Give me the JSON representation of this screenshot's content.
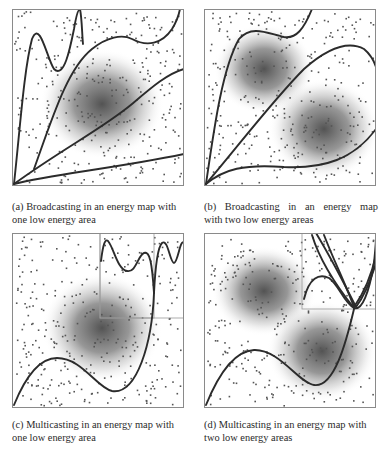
{
  "figure": {
    "panels": [
      {
        "id": "a",
        "caption_line1": "(a) Broadcasting in an energy map with",
        "caption_line2": "one low energy area",
        "mode": "broadcasting",
        "low_energy_areas": 1,
        "box": {
          "x": 12,
          "y": 9,
          "w": 172,
          "h": 177
        },
        "blobs": [
          {
            "cx": 90,
            "cy": 95,
            "rx": 62,
            "ry": 55
          }
        ],
        "sub_boxes": [],
        "curves": [
          "M2,175 C8,120 12,60 20,30 C28,10 35,50 42,60 C52,70 58,40 62,20 C64,8 66,0 68,0 M68,0 C70,10 70,25 71,35",
          "M22,160 C40,110 55,60 80,40 C95,28 110,25 120,30 C135,38 150,35 160,20 C165,12 167,5 168,0",
          "M2,175 C50,140 90,120 120,95 C140,78 155,65 172,60",
          "M2,175 C40,165 100,160 172,145"
        ],
        "dot_seed": 11
      },
      {
        "id": "b",
        "caption_line1": "(b) Broadcasting in an energy map",
        "caption_line2": "with two low energy areas",
        "mode": "broadcasting",
        "low_energy_areas": 2,
        "box": {
          "x": 204,
          "y": 9,
          "w": 172,
          "h": 177
        },
        "blobs": [
          {
            "cx": 60,
            "cy": 60,
            "rx": 50,
            "ry": 45
          },
          {
            "cx": 120,
            "cy": 120,
            "rx": 55,
            "ry": 50
          }
        ],
        "sub_boxes": [],
        "curves": [
          "M2,175 C10,120 18,60 35,30 C48,15 65,25 80,28 C92,30 100,20 108,0",
          "M2,175 C40,130 70,90 100,60 C125,38 145,32 160,40 C166,45 170,52 172,58",
          "M2,175 C20,160 40,155 80,158 C120,160 150,150 172,120"
        ],
        "dot_seed": 23
      },
      {
        "id": "c",
        "caption_line1": "(c) Multicasting in an energy map with",
        "caption_line2": "one low energy area",
        "mode": "multicasting",
        "low_energy_areas": 1,
        "box": {
          "x": 12,
          "y": 233,
          "w": 172,
          "h": 175
        },
        "blobs": [
          {
            "cx": 90,
            "cy": 95,
            "rx": 60,
            "ry": 55
          }
        ],
        "sub_boxes": [
          {
            "x": 88,
            "y": 0,
            "w": 84,
            "h": 85
          },
          {
            "x": 88,
            "y": 0,
            "w": 54,
            "h": 85
          }
        ],
        "curves": [
          "M2,172 C15,140 30,125 45,125 C70,125 85,155 100,158 C125,162 140,110 142,60 C143,40 145,15 150,10 C156,5 158,30 162,30 C166,30 168,5 172,10",
          "M142,60 C140,30 138,18 132,20 C126,22 124,40 115,38 C105,36 102,15 96,8 C92,4 90,20 89,28"
        ],
        "dot_seed": 37
      },
      {
        "id": "d",
        "caption_line1": "(d) Multicasting in an energy map with",
        "caption_line2": "two low energy areas",
        "mode": "multicasting",
        "low_energy_areas": 2,
        "box": {
          "x": 204,
          "y": 233,
          "w": 172,
          "h": 175
        },
        "blobs": [
          {
            "cx": 60,
            "cy": 58,
            "rx": 52,
            "ry": 45
          },
          {
            "cx": 118,
            "cy": 118,
            "rx": 55,
            "ry": 50
          }
        ],
        "sub_boxes": [
          {
            "x": 98,
            "y": 0,
            "w": 74,
            "h": 76
          }
        ],
        "curves": [
          "M2,172 C15,140 30,118 50,117 C75,116 95,150 110,152 C130,155 142,110 150,76",
          "M100,66 C105,45 115,40 125,45 C135,52 140,70 150,75 C158,78 165,60 170,30 C171,20 172,10 172,5",
          "M108,2 C115,25 130,50 150,75",
          "M112,0 C130,30 145,60 152,74 C158,66 166,50 172,30",
          "M120,2 C130,28 142,52 150,74 C160,60 168,40 172,22"
        ],
        "dot_seed": 53
      }
    ],
    "colors": {
      "frame": "#8a8a8a",
      "curve": "#2b2b2b",
      "dot": "#555555",
      "shade_center": "#4a4a4a",
      "sub_box": "#9a9a9a"
    }
  }
}
